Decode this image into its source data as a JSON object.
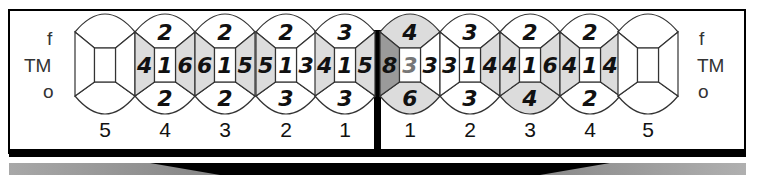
{
  "diagram": {
    "type": "dental-surface-chart",
    "row_labels": {
      "top": "f",
      "middle": "TM",
      "bottom": "o"
    },
    "colors": {
      "shade": "#dcdcdc",
      "dark_shade": "#9a9a9a",
      "line": "#333333",
      "frame": "#000000",
      "gray_text": "#777777"
    },
    "left_quadrant": [
      {
        "tooth": "5",
        "cx": 105,
        "top": "",
        "bottom": "",
        "left": "",
        "center": "",
        "right": "",
        "shade": []
      },
      {
        "tooth": "4",
        "cx": 165,
        "top": "2",
        "bottom": "2",
        "left": "4",
        "center": "1",
        "right": "6",
        "shade": [
          "left",
          "right"
        ]
      },
      {
        "tooth": "3",
        "cx": 225,
        "top": "2",
        "bottom": "2",
        "left": "6",
        "center": "1",
        "right": "5",
        "shade": [
          "left",
          "right"
        ]
      },
      {
        "tooth": "2",
        "cx": 286,
        "top": "2",
        "bottom": "3",
        "left": "5",
        "center": "1",
        "right": "3",
        "shade": [
          "left"
        ]
      },
      {
        "tooth": "1",
        "cx": 345,
        "top": "3",
        "bottom": "3",
        "left": "4",
        "center": "1",
        "right": "5",
        "shade": [
          "left",
          "right"
        ]
      }
    ],
    "right_quadrant": [
      {
        "tooth": "1",
        "cx": 410,
        "top": "4",
        "bottom": "6",
        "left": "8",
        "center": "3",
        "right": "3",
        "shade": [
          "top",
          "bottom"
        ],
        "dark": [
          "left"
        ],
        "gray_center": true
      },
      {
        "tooth": "2",
        "cx": 470,
        "top": "3",
        "bottom": "3",
        "left": "3",
        "center": "1",
        "right": "4",
        "shade": [
          "right"
        ]
      },
      {
        "tooth": "3",
        "cx": 530,
        "top": "2",
        "bottom": "4",
        "left": "4",
        "center": "1",
        "right": "6",
        "shade": [
          "left",
          "right",
          "bottom"
        ]
      },
      {
        "tooth": "4",
        "cx": 590,
        "top": "2",
        "bottom": "2",
        "left": "4",
        "center": "1",
        "right": "4",
        "shade": [
          "left",
          "right"
        ]
      },
      {
        "tooth": "5",
        "cx": 648,
        "top": "",
        "bottom": "",
        "left": "",
        "center": "",
        "right": "",
        "shade": []
      }
    ]
  }
}
